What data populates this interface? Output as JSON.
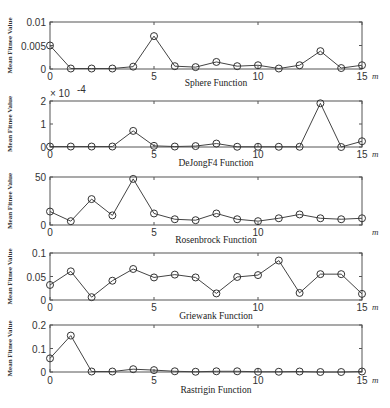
{
  "chart_data": [
    {
      "type": "line",
      "title": "Sphere Function",
      "xlabel": "m",
      "ylabel": "Mean Fitnee Value",
      "x": [
        0,
        1,
        2,
        3,
        4,
        5,
        6,
        7,
        8,
        9,
        10,
        11,
        12,
        13,
        14,
        15
      ],
      "values": [
        0.005,
        0.0001,
        0.0001,
        0.0001,
        0.0005,
        0.007,
        0.0006,
        0.0004,
        0.0015,
        0.0006,
        0.0008,
        0.0001,
        0.0008,
        0.0038,
        0.0002,
        0.0008
      ],
      "ylim": [
        0,
        0.01
      ],
      "yticks": [
        "0",
        "0.005",
        "0.01"
      ],
      "xticks": [
        "0",
        "5",
        "10",
        "15"
      ],
      "xlim": [
        0,
        15
      ],
      "marker": "circle",
      "grid": false
    },
    {
      "type": "line",
      "title": "DeJongF4 Function",
      "xlabel": "m",
      "ylabel": "Mean Fitnee Value",
      "y_multiplier": "x 10^-4",
      "x": [
        0,
        1,
        2,
        3,
        4,
        5,
        6,
        7,
        8,
        9,
        10,
        11,
        12,
        13,
        14,
        15
      ],
      "values": [
        2e-06,
        2e-06,
        2e-06,
        2e-06,
        7e-05,
        5e-06,
        2e-06,
        4e-06,
        1.5e-05,
        1e-06,
        1e-06,
        1e-06,
        1e-06,
        0.00019,
        0.0,
        2.5e-05
      ],
      "ylim": [
        0,
        0.0002
      ],
      "yticks": [
        "0",
        "1",
        "2"
      ],
      "xticks": [
        "0",
        "5",
        "10",
        "15"
      ],
      "xlim": [
        0,
        15
      ],
      "marker": "circle",
      "grid": false
    },
    {
      "type": "line",
      "title": "Rosenbrock Function",
      "xlabel": "m",
      "ylabel": "Mean Fitnee Value",
      "x": [
        0,
        1,
        2,
        3,
        4,
        5,
        6,
        7,
        8,
        9,
        10,
        11,
        12,
        13,
        14,
        15
      ],
      "values": [
        14,
        4,
        27,
        10,
        48,
        12,
        6,
        5,
        12,
        6,
        4,
        7,
        11,
        7,
        6,
        7
      ],
      "ylim": [
        0,
        50
      ],
      "yticks": [
        "0",
        "50"
      ],
      "xticks": [
        "0",
        "5",
        "10"
      ],
      "xlim": [
        0,
        15
      ],
      "marker": "circle",
      "grid": false
    },
    {
      "type": "line",
      "title": "Griewank Function",
      "xlabel": "m",
      "ylabel": "Mean Fitnee Value",
      "x": [
        0,
        1,
        2,
        3,
        4,
        5,
        6,
        7,
        8,
        9,
        10,
        11,
        12,
        13,
        14,
        15
      ],
      "values": [
        0.032,
        0.061,
        0.006,
        0.041,
        0.066,
        0.048,
        0.054,
        0.048,
        0.014,
        0.049,
        0.053,
        0.084,
        0.015,
        0.055,
        0.055,
        0.013
      ],
      "ylim": [
        0,
        0.1
      ],
      "yticks": [
        "0",
        "0.05",
        "0.1"
      ],
      "xticks": [
        "0",
        "5",
        "10",
        "15"
      ],
      "xlim": [
        0,
        15
      ],
      "marker": "circle",
      "grid": false
    },
    {
      "type": "line",
      "title": "Rastrigin Function",
      "xlabel": "m",
      "ylabel": "Mean Fitnee Value",
      "x": [
        0,
        1,
        2,
        3,
        4,
        5,
        6,
        7,
        8,
        9,
        10,
        11,
        12,
        13,
        14,
        15
      ],
      "values": [
        0.058,
        0.155,
        0.002,
        0.002,
        0.012,
        0.008,
        0.003,
        0.001,
        0.003,
        0.003,
        0.001,
        0.001,
        0.002,
        0.0,
        0.0,
        0.002
      ],
      "ylim": [
        0,
        0.2
      ],
      "yticks": [
        "0",
        "0.1",
        "0.2"
      ],
      "xticks": [
        "0",
        "5",
        "10",
        "15"
      ],
      "xlim": [
        0,
        15
      ],
      "marker": "circle",
      "grid": false
    }
  ],
  "layout": {
    "panels": [
      {
        "top": 22,
        "bottom": 69,
        "left": 50,
        "right": 362,
        "title_y": 86,
        "xtick_y": 80
      },
      {
        "top": 101,
        "bottom": 147,
        "left": 50,
        "right": 362,
        "title_y": 166,
        "xtick_y": 158,
        "mult_y": 97
      },
      {
        "top": 177,
        "bottom": 225,
        "left": 50,
        "right": 362,
        "title_y": 243,
        "xtick_y": 236
      },
      {
        "top": 253,
        "bottom": 300,
        "left": 50,
        "right": 362,
        "title_y": 319,
        "xtick_y": 311
      },
      {
        "top": 325,
        "bottom": 372,
        "left": 50,
        "right": 362,
        "title_y": 393,
        "xtick_y": 384
      }
    ],
    "line_color": "#444444",
    "marker_color": "#333333"
  }
}
